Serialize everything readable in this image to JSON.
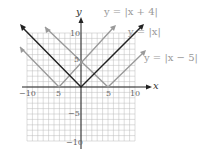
{
  "chart_data": {
    "type": "line",
    "title": "",
    "xlabel": "x",
    "ylabel": "y",
    "xlim": [
      -10,
      10
    ],
    "ylim": [
      -10,
      10
    ],
    "grid": true,
    "x_ticks": [
      -10,
      -5,
      5,
      10
    ],
    "y_ticks": [
      10,
      5,
      -5,
      -10
    ],
    "series": [
      {
        "name": "y = |x + 4|",
        "vertex": [
          -4,
          0
        ],
        "color": "#999999"
      },
      {
        "name": "y = |x|",
        "vertex": [
          0,
          0
        ],
        "color": "#222222"
      },
      {
        "name": "y = |x − 5|",
        "vertex": [
          5,
          0
        ],
        "color": "#999999"
      }
    ]
  },
  "labels": {
    "x_axis": "x",
    "y_axis": "y",
    "eq1": "y = |x + 4|",
    "eq2": "y = |x|",
    "eq3": "y = |x − 5|",
    "t_xn10": "−10",
    "t_xn5": "5",
    "t_x5": "5",
    "t_x10": "10",
    "t_y10": "10",
    "t_y5": "5",
    "t_yn5": "−5",
    "t_yn10": "−10"
  }
}
